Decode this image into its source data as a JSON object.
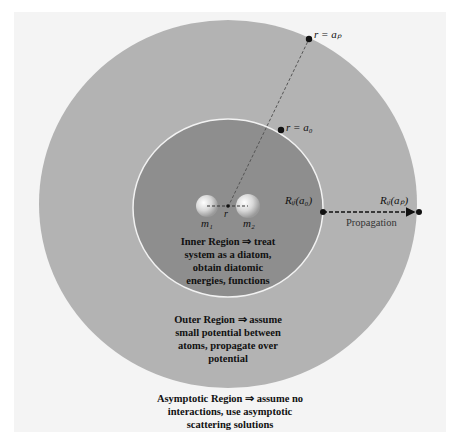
{
  "colors": {
    "background": "#f4f4f4",
    "outer_region": "#b3b3b3",
    "inner_region": "#8e8e8e",
    "inner_border": "#f2f2f2",
    "marker": "#111111",
    "dashed_line": "#555555"
  },
  "labels": {
    "r_ap": "r = aₚ",
    "r_a0": "r = a₀",
    "R_a0": "Rᵢⱼ(a₀)",
    "R_ap": "Rᵢⱼ(aₚ)",
    "m1": "m₁",
    "m2": "m₂",
    "r": "r",
    "propagation": "Propagation"
  },
  "regions": {
    "inner": [
      "Inner Region ⇒ treat",
      "system as a diatom,",
      "obtain diatomic",
      "energies, functions"
    ],
    "outer": [
      "Outer Region ⇒ assume",
      "small potential between",
      "atoms, propagate over",
      "potential"
    ],
    "asymptotic": [
      "Asymptotic Region ⇒ assume no",
      "interactions, use asymptotic",
      "scattering solutions"
    ]
  }
}
